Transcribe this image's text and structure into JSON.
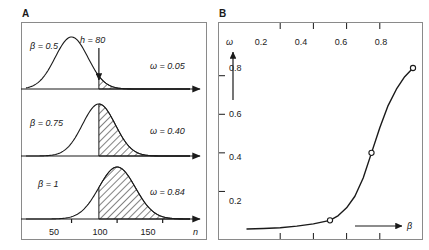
{
  "figure": {
    "panels": [
      {
        "key": "A",
        "letter": "A"
      },
      {
        "key": "B",
        "letter": "B"
      }
    ]
  },
  "panelA": {
    "letter": "A",
    "threshold_label": "h = 80",
    "threshold_value": 80,
    "x_axis_name": "n",
    "x_ticks": [
      "50",
      "100",
      "150"
    ],
    "x_tick_values": [
      50,
      100,
      150
    ],
    "rows": [
      {
        "beta_label": "β = 0.5",
        "omega_label": "ω = 0.05",
        "beta": 0.5,
        "omega": 0.05,
        "mean": 50,
        "sd": 18,
        "shade_from": 80
      },
      {
        "beta_label": "β = 0.75",
        "omega_label": "ω = 0.40",
        "beta": 0.75,
        "omega": 0.4,
        "mean": 80,
        "sd": 18,
        "shade_from": 80
      },
      {
        "beta_label": "β = 1",
        "omega_label": "ω = 0.84",
        "beta": 1,
        "omega": 0.84,
        "mean": 100,
        "sd": 20,
        "shade_from": 80
      }
    ]
  },
  "panelB": {
    "letter": "B",
    "y_axis_name": "ω",
    "x_axis_name": "β",
    "x_ticks": [
      "0.2",
      "0.4",
      "0.6",
      "0.8"
    ],
    "x_tick_values": [
      0.2,
      0.4,
      0.6,
      0.8
    ],
    "y_ticks": [
      "0.8",
      "0.6",
      "0.4",
      "0.2"
    ],
    "y_tick_values": [
      0.8,
      0.6,
      0.4,
      0.2
    ]
  },
  "chart_data": [
    {
      "type": "area",
      "title": "Panel A — sampling distributions with rejection tail",
      "xlabel": "n",
      "ylabel": "",
      "xlim": [
        0,
        180
      ],
      "grid": false,
      "legend": "none",
      "annotations": [
        "h = 80",
        "β = 0.5",
        "β = 0.75",
        "β = 1",
        "ω = 0.05",
        "ω = 0.40",
        "ω = 0.84"
      ],
      "xticks": [
        50,
        100,
        150
      ],
      "series": [
        {
          "name": "β = 0.5",
          "mean": 50,
          "sd": 18,
          "shaded_tail_from": 80,
          "shaded_area": 0.05
        },
        {
          "name": "β = 0.75",
          "mean": 80,
          "sd": 18,
          "shaded_tail_from": 80,
          "shaded_area": 0.4
        },
        {
          "name": "β = 1",
          "mean": 100,
          "sd": 20,
          "shaded_tail_from": 80,
          "shaded_area": 0.84
        }
      ]
    },
    {
      "type": "line",
      "title": "Panel B — power ω as a function of β",
      "xlabel": "β",
      "ylabel": "ω",
      "xlim": [
        0,
        1
      ],
      "ylim": [
        0,
        1
      ],
      "xticks": [
        0.2,
        0.4,
        0.6,
        0.8
      ],
      "yticks": [
        0.2,
        0.4,
        0.6,
        0.8
      ],
      "grid": false,
      "legend": "none",
      "x": [
        0.0,
        0.1,
        0.2,
        0.3,
        0.4,
        0.5,
        0.55,
        0.6,
        0.65,
        0.7,
        0.75,
        0.8,
        0.85,
        0.9,
        0.95,
        1.0
      ],
      "values": [
        0.005,
        0.008,
        0.012,
        0.02,
        0.032,
        0.05,
        0.075,
        0.115,
        0.175,
        0.27,
        0.4,
        0.53,
        0.645,
        0.73,
        0.795,
        0.84
      ],
      "markers": [
        {
          "x": 0.5,
          "y": 0.05
        },
        {
          "x": 0.75,
          "y": 0.4
        },
        {
          "x": 1.0,
          "y": 0.84
        }
      ]
    }
  ]
}
